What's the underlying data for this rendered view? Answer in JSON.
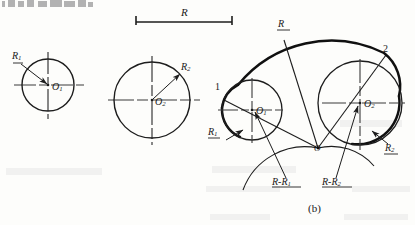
{
  "figure": {
    "caption": "(b)"
  },
  "top_dimension": {
    "label": "R",
    "x_start": 136,
    "x_end": 232,
    "y": 22
  },
  "circle_one": {
    "center_label": "O",
    "center_sub": "1",
    "radius_label": "R",
    "radius_sub": "1",
    "cx": 48,
    "cy": 85,
    "r": 26
  },
  "circle_two": {
    "center_label": "O",
    "center_sub": "2",
    "radius_label": "R",
    "radius_sub": "2",
    "cx": 152,
    "cy": 100,
    "r": 38
  },
  "composite": {
    "big_arc_label": "R",
    "tangent_point_1": "1",
    "tangent_point_2": "2",
    "center_o_label": "O",
    "circle_one": {
      "center_label": "O",
      "center_sub": "1",
      "radius_label": "R",
      "radius_sub": "1",
      "cx": 252,
      "cy": 110,
      "r": 30
    },
    "circle_two": {
      "center_label": "O",
      "center_sub": "2",
      "radius_label": "R",
      "radius_sub": "2",
      "cx": 360,
      "cy": 103,
      "r": 42
    },
    "construction": {
      "arc_one_label": "R-R",
      "arc_one_sub": "1",
      "arc_two_label": "R-R",
      "arc_two_sub": "2"
    }
  },
  "colors": {
    "ink": "#1d1d1d",
    "thin": "#2a2a2a",
    "centerline": "#3a3a3a",
    "paper": "#fdfdfb"
  }
}
